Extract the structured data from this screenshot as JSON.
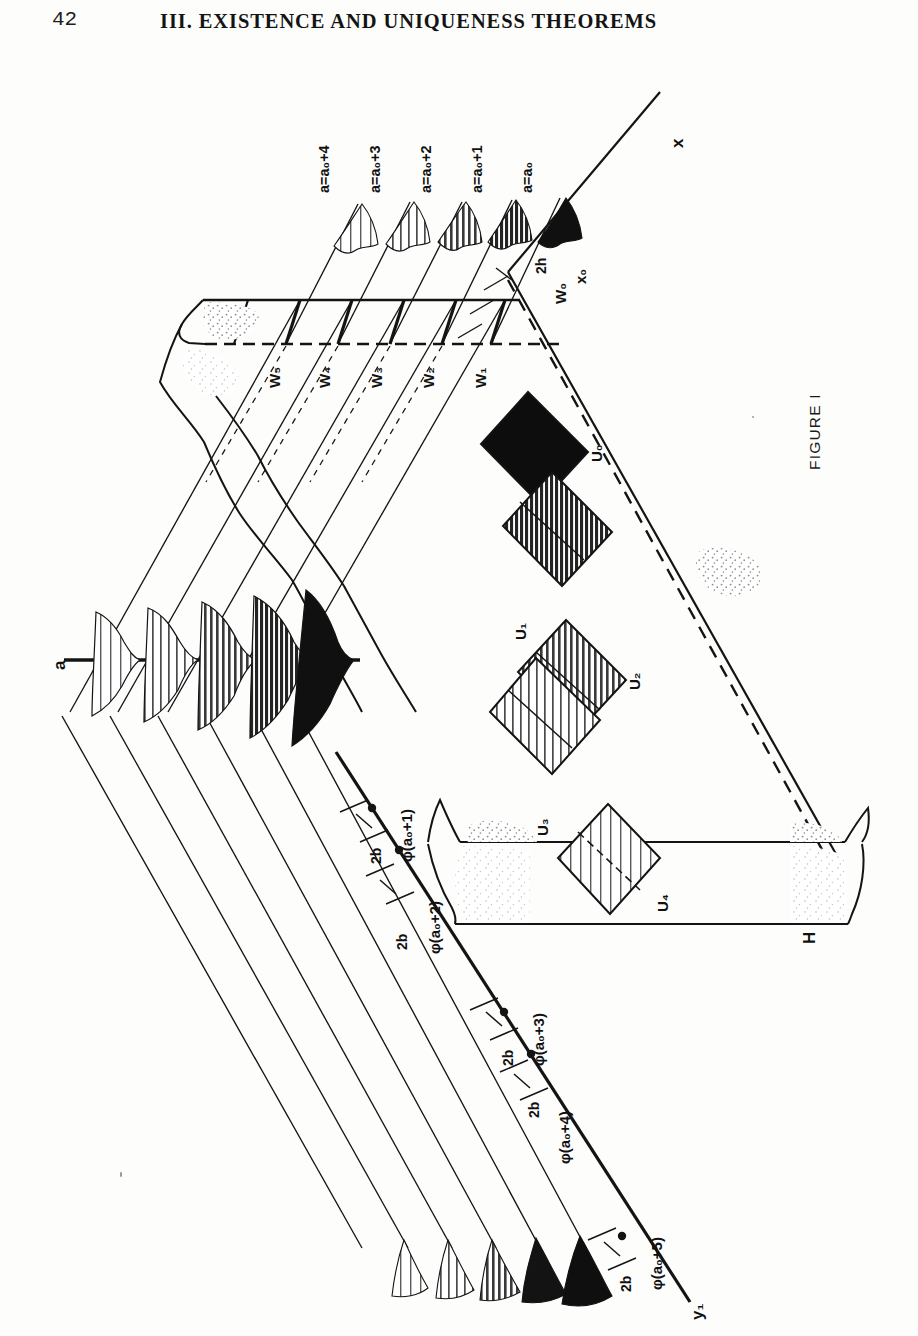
{
  "page": {
    "folio": "42",
    "running_head": "III.   EXISTENCE AND UNIQUENESS THEOREMS"
  },
  "figure": {
    "caption": "FIGURE I",
    "axes": [
      {
        "name": "x-axis-label",
        "text": "x"
      },
      {
        "name": "a-axis-label",
        "text": "a"
      },
      {
        "name": "y1-axis-label",
        "text": "y₁"
      },
      {
        "name": "h-label",
        "text": "H"
      }
    ],
    "origin_labels": [
      {
        "name": "x0-label",
        "text": "x₀"
      },
      {
        "name": "w0-label",
        "text": "W₀"
      },
      {
        "name": "two-a-label",
        "text": "2a"
      },
      {
        "name": "two-h-label",
        "text": "2h"
      }
    ],
    "a_level_labels": [
      {
        "text": "a=a₀"
      },
      {
        "text": "a=a₀+1"
      },
      {
        "text": "a=a₀+2"
      },
      {
        "text": "a=a₀+3"
      },
      {
        "text": "a=a₀+4"
      }
    ],
    "w_strip_labels": [
      {
        "text": "W₁"
      },
      {
        "text": "W₂"
      },
      {
        "text": "W₃"
      },
      {
        "text": "W₄"
      },
      {
        "text": "W₅"
      }
    ],
    "u_region_labels": [
      {
        "text": "U₀",
        "fill": "solid-black"
      },
      {
        "text": "U₁",
        "fill": "dark-hatch"
      },
      {
        "text": "U₂",
        "fill": "medium-hatch"
      },
      {
        "text": "U₃",
        "fill": "light-hatch"
      },
      {
        "text": "U₄",
        "fill": "open-hatch"
      }
    ],
    "phi_labels": [
      {
        "text": "φ(a₀+1)"
      },
      {
        "text": "φ(a₀+2)"
      },
      {
        "text": "φ(a₀+3)"
      },
      {
        "text": "φ(a₀+4)"
      },
      {
        "text": "φ(a₀+5)"
      }
    ],
    "interval_labels": [
      {
        "text": "2b"
      },
      {
        "text": "2b"
      },
      {
        "text": "2b"
      },
      {
        "text": "2b"
      },
      {
        "text": "2b"
      }
    ]
  },
  "colors": {
    "ink": "#141414",
    "paper": "#fdfdfc",
    "stipple": "#8c8c8c",
    "hatch_dark": "#2b2b2b",
    "hatch_mid": "#555555"
  }
}
